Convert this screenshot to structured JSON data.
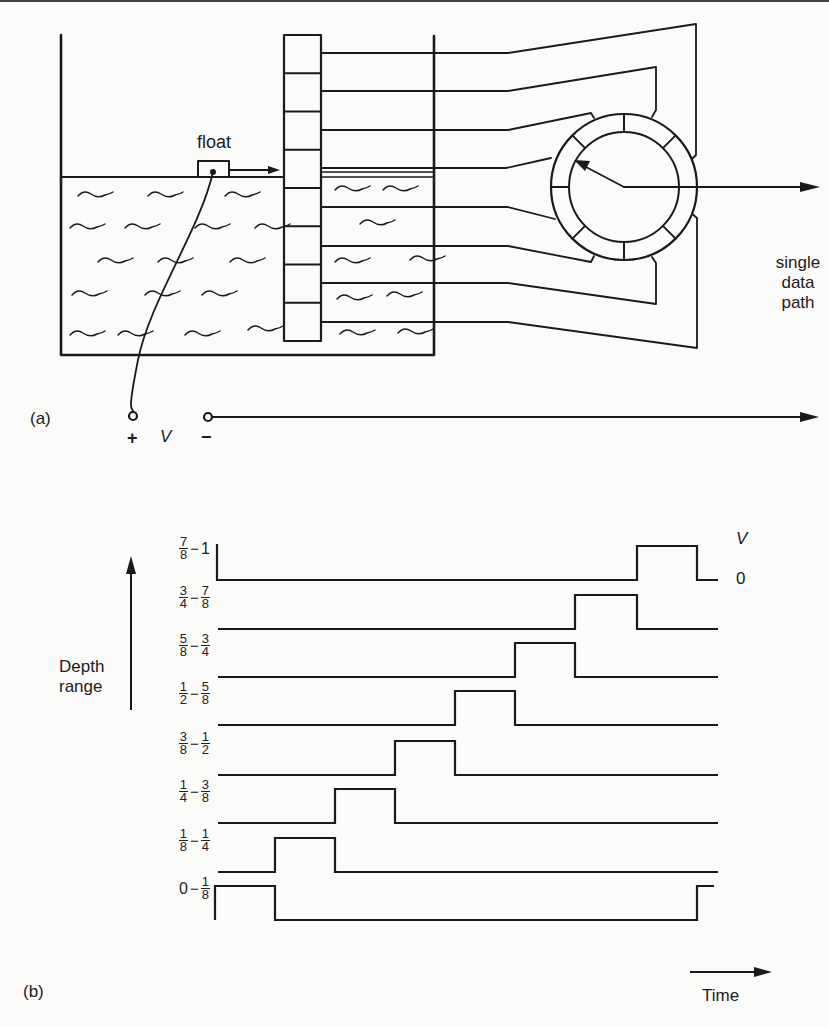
{
  "figure": {
    "part_a": {
      "label": "(a)",
      "float_label": "float",
      "output_label_lines": [
        "single",
        "data",
        "path"
      ],
      "terminal_plus": "+",
      "terminal_voltage": "V",
      "terminal_minus": "−",
      "probe_cell_count": 8,
      "commutator_segments": 8
    },
    "part_b": {
      "label": "(b)",
      "y_axis_label_lines": [
        "Depth",
        "range"
      ],
      "x_axis_label": "Time",
      "level_high_label": "V",
      "level_low_label": "0",
      "rows": [
        {
          "range": "7/8 − 1",
          "from": {
            "num": "7",
            "den": "8"
          },
          "to": {
            "whole": "1"
          },
          "pulse_slot": 7
        },
        {
          "range": "3/4 − 7/8",
          "from": {
            "num": "3",
            "den": "4"
          },
          "to": {
            "num": "7",
            "den": "8"
          },
          "pulse_slot": 6
        },
        {
          "range": "5/8 − 3/4",
          "from": {
            "num": "5",
            "den": "8"
          },
          "to": {
            "num": "3",
            "den": "4"
          },
          "pulse_slot": 5
        },
        {
          "range": "1/2 − 5/8",
          "from": {
            "num": "1",
            "den": "2"
          },
          "to": {
            "num": "5",
            "den": "8"
          },
          "pulse_slot": 4
        },
        {
          "range": "3/8 − 1/2",
          "from": {
            "num": "3",
            "den": "8"
          },
          "to": {
            "num": "1",
            "den": "2"
          },
          "pulse_slot": 3
        },
        {
          "range": "1/4 − 3/8",
          "from": {
            "num": "1",
            "den": "4"
          },
          "to": {
            "num": "3",
            "den": "8"
          },
          "pulse_slot": 2
        },
        {
          "range": "1/8 − 1/4",
          "from": {
            "num": "1",
            "den": "8"
          },
          "to": {
            "num": "1",
            "den": "4"
          },
          "pulse_slot": 1
        },
        {
          "range": "0 − 1/8",
          "from": {
            "whole": "0"
          },
          "to": {
            "num": "1",
            "den": "8"
          },
          "pulse_slot": 0
        }
      ]
    }
  },
  "chart_data": {
    "type": "line",
    "xlabel": "Time",
    "ylabel": "Depth range",
    "levels": {
      "high": "V",
      "low": "0"
    },
    "time_slots": 8,
    "series": [
      {
        "name": "7/8-1",
        "high_during_slot": [
          7
        ]
      },
      {
        "name": "3/4-7/8",
        "high_during_slot": [
          6
        ]
      },
      {
        "name": "5/8-3/4",
        "high_during_slot": [
          5
        ]
      },
      {
        "name": "1/2-5/8",
        "high_during_slot": [
          4
        ]
      },
      {
        "name": "3/8-1/2",
        "high_during_slot": [
          3
        ]
      },
      {
        "name": "1/4-3/8",
        "high_during_slot": [
          2
        ]
      },
      {
        "name": "1/8-1/4",
        "high_during_slot": [
          1
        ]
      },
      {
        "name": "0-1/8",
        "high_during_slot": [
          0,
          8
        ]
      }
    ],
    "grid": false
  }
}
